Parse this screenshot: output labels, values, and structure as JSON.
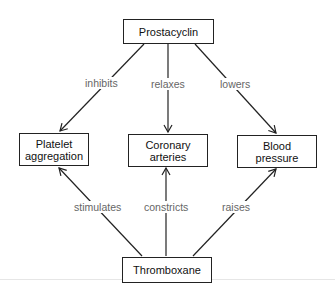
{
  "diagram": {
    "nodes": {
      "top": {
        "label": "Prostacyclin"
      },
      "left": {
        "label_line1": "Platelet",
        "label_line2": "aggregation"
      },
      "center": {
        "label_line1": "Coronary",
        "label_line2": "arteries"
      },
      "right": {
        "label_line1": "Blood",
        "label_line2": "pressure"
      },
      "bottom": {
        "label": "Thromboxane"
      }
    },
    "edges": {
      "top_left": "inhibits",
      "top_center": "relaxes",
      "top_right": "lowers",
      "bottom_left": "stimulates",
      "bottom_center": "constricts",
      "bottom_right": "raises"
    }
  }
}
